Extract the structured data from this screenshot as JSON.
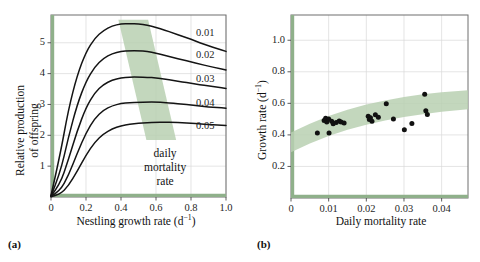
{
  "figure": {
    "background": "#ffffff",
    "accent_green": "#8fb08a",
    "band_green": "#b9d0b2",
    "curve_color": "#141414",
    "grid_color": "#d8d8d8",
    "frame_color": "#6e6e6e",
    "point_color": "#111111"
  },
  "panels": [
    {
      "letter": "(a)",
      "letter_name": "panel-letter-a",
      "chart_data": {
        "type": "line",
        "title": "",
        "xlabel": "Nestling growth rate (d−1)",
        "ylabel": "Relative production of offspring",
        "ylabel_line1": "Relative production",
        "ylabel_line2": "of offspring",
        "xlim": [
          0,
          1.0
        ],
        "ylim": [
          0,
          5.9
        ],
        "xticks": [
          0,
          0.2,
          0.4,
          0.6,
          0.8,
          1.0
        ],
        "xticklabels": [
          "0",
          "0.2",
          "0.4",
          "0.6",
          "0.8",
          "1.0"
        ],
        "yticks": [
          1,
          2,
          3,
          4,
          5
        ],
        "yticklabels": [
          "1",
          "2",
          "3",
          "4",
          "5"
        ],
        "grid": true,
        "legend_position": "inline-right-of-curves",
        "annotation": {
          "lines": [
            "daily",
            "mortality",
            "rate"
          ],
          "x": 0.72,
          "y": 1.45
        },
        "shaded_band": {
          "label": "optimal growth rate band",
          "color": "#b9d0b2",
          "polygon_xy": [
            [
              0.385,
              5.75
            ],
            [
              0.555,
              5.75
            ],
            [
              0.715,
              1.85
            ],
            [
              0.545,
              1.85
            ]
          ]
        },
        "series": [
          {
            "name": "0.01",
            "label": "0.01",
            "daily_mortality_rate": 0.01,
            "peak_x": 0.5,
            "peak_y": 5.62,
            "end_y": 4.72,
            "x": [
              0.0,
              0.05,
              0.1,
              0.15,
              0.2,
              0.25,
              0.3,
              0.35,
              0.4,
              0.45,
              0.5,
              0.55,
              0.6,
              0.65,
              0.7,
              0.75,
              0.8,
              0.85,
              0.9,
              0.95,
              1.0
            ],
            "y": [
              0.05,
              1.3,
              2.85,
              3.95,
              4.7,
              5.15,
              5.4,
              5.55,
              5.61,
              5.62,
              5.62,
              5.57,
              5.5,
              5.41,
              5.31,
              5.21,
              5.11,
              5.0,
              4.9,
              4.81,
              4.72
            ]
          },
          {
            "name": "0.02",
            "label": "0.02",
            "daily_mortality_rate": 0.02,
            "peak_x": 0.52,
            "peak_y": 4.74,
            "end_y": 4.12,
            "x": [
              0.0,
              0.05,
              0.1,
              0.15,
              0.2,
              0.25,
              0.3,
              0.35,
              0.4,
              0.45,
              0.5,
              0.55,
              0.6,
              0.65,
              0.7,
              0.75,
              0.8,
              0.85,
              0.9,
              0.95,
              1.0
            ],
            "y": [
              0.04,
              0.72,
              1.95,
              3.0,
              3.75,
              4.22,
              4.5,
              4.65,
              4.72,
              4.74,
              4.74,
              4.72,
              4.66,
              4.59,
              4.52,
              4.45,
              4.38,
              4.31,
              4.24,
              4.18,
              4.12
            ]
          },
          {
            "name": "0.03",
            "label": "0.03",
            "daily_mortality_rate": 0.03,
            "peak_x": 0.56,
            "peak_y": 3.89,
            "end_y": 3.52,
            "x": [
              0.0,
              0.05,
              0.1,
              0.15,
              0.2,
              0.25,
              0.3,
              0.35,
              0.4,
              0.45,
              0.5,
              0.55,
              0.6,
              0.65,
              0.7,
              0.75,
              0.8,
              0.85,
              0.9,
              0.95,
              1.0
            ],
            "y": [
              0.03,
              0.38,
              1.22,
              2.15,
              2.9,
              3.38,
              3.65,
              3.79,
              3.86,
              3.89,
              3.89,
              3.88,
              3.86,
              3.82,
              3.78,
              3.73,
              3.69,
              3.64,
              3.6,
              3.56,
              3.52
            ]
          },
          {
            "name": "0.04",
            "label": "0.04",
            "daily_mortality_rate": 0.04,
            "peak_x": 0.62,
            "peak_y": 3.08,
            "end_y": 2.88,
            "x": [
              0.0,
              0.05,
              0.1,
              0.15,
              0.2,
              0.25,
              0.3,
              0.35,
              0.4,
              0.45,
              0.5,
              0.55,
              0.6,
              0.65,
              0.7,
              0.75,
              0.8,
              0.85,
              0.9,
              0.95,
              1.0
            ],
            "y": [
              0.02,
              0.18,
              0.7,
              1.42,
              2.08,
              2.55,
              2.82,
              2.96,
              3.03,
              3.06,
              3.07,
              3.08,
              3.08,
              3.06,
              3.04,
              3.01,
              2.98,
              2.95,
              2.92,
              2.9,
              2.88
            ]
          },
          {
            "name": "0.05",
            "label": "0.05",
            "daily_mortality_rate": 0.05,
            "peak_x": 0.7,
            "peak_y": 2.42,
            "end_y": 2.32,
            "x": [
              0.0,
              0.05,
              0.1,
              0.15,
              0.2,
              0.25,
              0.3,
              0.35,
              0.4,
              0.45,
              0.5,
              0.55,
              0.6,
              0.65,
              0.7,
              0.75,
              0.8,
              0.85,
              0.9,
              0.95,
              1.0
            ],
            "y": [
              0.01,
              0.08,
              0.36,
              0.84,
              1.36,
              1.78,
              2.05,
              2.21,
              2.31,
              2.36,
              2.39,
              2.41,
              2.42,
              2.42,
              2.42,
              2.41,
              2.39,
              2.37,
              2.35,
              2.33,
              2.32
            ]
          }
        ]
      }
    },
    {
      "letter": "(b)",
      "letter_name": "panel-letter-b",
      "chart_data": {
        "type": "scatter",
        "title": "",
        "xlabel": "Daily mortality rate",
        "ylabel": "Growth rate (d−1)",
        "xlim": [
          0,
          0.047
        ],
        "ylim": [
          0,
          1.16
        ],
        "xticks": [
          0,
          0.01,
          0.02,
          0.03,
          0.04
        ],
        "xticklabels": [
          "0",
          "0.01",
          "0.02",
          "0.03",
          "0.04"
        ],
        "yticks": [
          0.2,
          0.4,
          0.6,
          0.8,
          1.0
        ],
        "yticklabels": [
          "0.2",
          "0.4",
          "0.6",
          "0.8",
          "1.0"
        ],
        "grid": true,
        "legend_position": "none",
        "shaded_band": {
          "label": "predicted optimal growth rate",
          "color": "#b9d0b2",
          "upper_x": [
            0.0,
            0.005,
            0.01,
            0.015,
            0.02,
            0.025,
            0.03,
            0.035,
            0.04,
            0.047
          ],
          "upper_y": [
            0.415,
            0.47,
            0.52,
            0.56,
            0.592,
            0.618,
            0.64,
            0.657,
            0.67,
            0.683
          ],
          "lower_x": [
            0.0,
            0.005,
            0.01,
            0.015,
            0.02,
            0.025,
            0.03,
            0.035,
            0.04,
            0.047
          ],
          "lower_y": [
            0.29,
            0.345,
            0.393,
            0.432,
            0.464,
            0.491,
            0.513,
            0.531,
            0.546,
            0.562
          ]
        },
        "points": [
          {
            "x": 0.007,
            "y": 0.412
          },
          {
            "x": 0.0088,
            "y": 0.492
          },
          {
            "x": 0.0092,
            "y": 0.505
          },
          {
            "x": 0.0095,
            "y": 0.481
          },
          {
            "x": 0.01,
            "y": 0.5
          },
          {
            "x": 0.0101,
            "y": 0.412
          },
          {
            "x": 0.0108,
            "y": 0.487
          },
          {
            "x": 0.0112,
            "y": 0.47
          },
          {
            "x": 0.012,
            "y": 0.479
          },
          {
            "x": 0.0128,
            "y": 0.488
          },
          {
            "x": 0.0133,
            "y": 0.482
          },
          {
            "x": 0.0141,
            "y": 0.476
          },
          {
            "x": 0.0205,
            "y": 0.518
          },
          {
            "x": 0.0208,
            "y": 0.497
          },
          {
            "x": 0.0211,
            "y": 0.508
          },
          {
            "x": 0.0215,
            "y": 0.487
          },
          {
            "x": 0.0224,
            "y": 0.528
          },
          {
            "x": 0.0232,
            "y": 0.512
          },
          {
            "x": 0.0253,
            "y": 0.598
          },
          {
            "x": 0.0272,
            "y": 0.501
          },
          {
            "x": 0.0301,
            "y": 0.432
          },
          {
            "x": 0.0321,
            "y": 0.472
          },
          {
            "x": 0.0355,
            "y": 0.658
          },
          {
            "x": 0.0358,
            "y": 0.553
          },
          {
            "x": 0.0362,
            "y": 0.53
          }
        ]
      }
    }
  ]
}
